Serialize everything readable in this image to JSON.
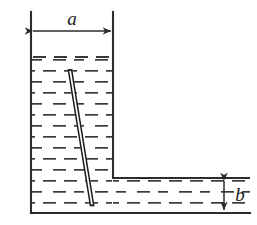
{
  "figure": {
    "type": "line-diagram",
    "background_color": "#ffffff",
    "line_color": "#2b2b2b",
    "hatch_color": "#3a3a3a",
    "rod_color": "#1a1a1a",
    "width": 257,
    "height": 225
  },
  "labels": {
    "width_label": "a",
    "depth_label": "b"
  },
  "dimensions": {
    "width_dimension": {
      "name": "a",
      "orientation": "horizontal",
      "meaning": "width of the tall left column of the vessel",
      "x_start": 31,
      "x_end": 113,
      "y": 31,
      "label_x": 72,
      "label_y": 22
    },
    "depth_dimension": {
      "name": "b",
      "orientation": "vertical",
      "meaning": "depth of liquid in the shallow right basin",
      "x": 224,
      "y_start": 178,
      "y_end": 213,
      "label_x": 240,
      "label_y": 201
    }
  },
  "vessel": {
    "left_wall_x": 31,
    "inner_wall_x": 113,
    "top_y": 12,
    "step_y": 178,
    "bottom_y": 213,
    "right_edge_x": 250,
    "description": "Tall narrow column on the left joined to a shallow wide basin on the right, forming a step"
  },
  "liquid": {
    "column_surface_y": 57,
    "basin_surface_y": 178,
    "bottom_y": 213,
    "hatch_style": "offset dashed rows",
    "row_spacing": 11,
    "dash_length": 13
  },
  "rod": {
    "description": "thin straight rod leaning in the liquid, drawn as a hollow double line",
    "top_x": 70,
    "top_y": 70,
    "bottom_x": 92,
    "bottom_y": 205,
    "thickness": 4
  }
}
